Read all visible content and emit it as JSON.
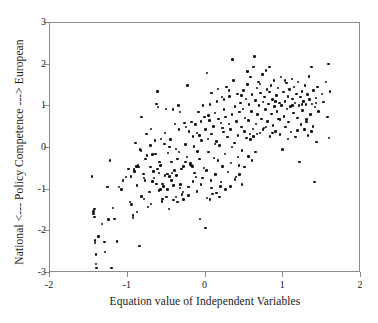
{
  "chart_data": {
    "type": "scatter",
    "title": "",
    "xlabel": "Equation value of Independent Variables",
    "ylabel": "National <--- Policy Competence ---> European",
    "xlim": [
      -2,
      2
    ],
    "ylim": [
      -3,
      3
    ],
    "xticks": [
      -2,
      -1,
      0,
      1,
      2
    ],
    "yticks": [
      -3,
      -2,
      -1,
      0,
      1,
      2,
      3
    ],
    "xtick_labels": [
      "-2",
      "-1",
      "0",
      "1",
      "2"
    ],
    "ytick_labels": [
      "-3",
      "-2",
      "-1",
      "0",
      "1",
      "2",
      "3"
    ],
    "grid": false,
    "legend": null,
    "marker": "filled-circle",
    "marker_color": "#111111",
    "frame_color": "#8a8a8a",
    "background": "#ffffff",
    "n_points": 330,
    "points": [
      [
        -1.44,
        -1.52
      ],
      [
        -1.44,
        -1.58
      ],
      [
        -1.43,
        -1.46
      ],
      [
        -1.43,
        -1.66
      ],
      [
        -1.42,
        -2.22
      ],
      [
        -1.42,
        -2.28
      ],
      [
        -1.41,
        -2.55
      ],
      [
        -1.41,
        -2.78
      ],
      [
        -1.4,
        -2.88
      ],
      [
        -1.46,
        -0.68
      ],
      [
        -1.38,
        -2.12
      ],
      [
        -1.33,
        -1.82
      ],
      [
        -1.3,
        -2.26
      ],
      [
        -1.29,
        -2.5
      ],
      [
        -1.26,
        -0.94
      ],
      [
        -1.25,
        -1.72
      ],
      [
        -1.23,
        -0.3
      ],
      [
        -1.21,
        -2.88
      ],
      [
        -1.19,
        -1.44
      ],
      [
        -1.17,
        -1.7
      ],
      [
        -1.14,
        -2.25
      ],
      [
        -1.11,
        -0.94
      ],
      [
        -1.08,
        -1.0
      ],
      [
        -1.06,
        -0.78
      ],
      [
        -0.97,
        -1.3
      ],
      [
        -0.95,
        -1.36
      ],
      [
        -0.93,
        -1.62
      ],
      [
        -0.93,
        -1.68
      ],
      [
        -0.92,
        -0.52
      ],
      [
        -0.91,
        -0.56
      ],
      [
        -0.9,
        0.12
      ],
      [
        -0.89,
        -0.44
      ],
      [
        -0.88,
        -1.54
      ],
      [
        -0.87,
        -0.42
      ],
      [
        -0.86,
        -0.46
      ],
      [
        -0.85,
        -2.35
      ],
      [
        -0.84,
        -0.04
      ],
      [
        -0.83,
        -0.06
      ],
      [
        -0.82,
        0.74
      ],
      [
        -0.8,
        -0.62
      ],
      [
        -0.79,
        -0.72
      ],
      [
        -0.78,
        -0.78
      ],
      [
        -0.77,
        -0.26
      ],
      [
        -0.76,
        0.34
      ],
      [
        -0.75,
        -0.18
      ],
      [
        -0.74,
        -1.42
      ],
      [
        -0.72,
        -1.06
      ],
      [
        -0.71,
        0.06
      ],
      [
        -0.7,
        0.46
      ],
      [
        -0.68,
        -0.8
      ],
      [
        -0.66,
        -0.72
      ],
      [
        -0.65,
        0.18
      ],
      [
        -0.64,
        -0.14
      ],
      [
        -0.63,
        1.06
      ],
      [
        -0.62,
        1.36
      ],
      [
        -0.61,
        0.98
      ],
      [
        -0.6,
        -0.6
      ],
      [
        -0.59,
        -0.34
      ],
      [
        -0.58,
        -0.42
      ],
      [
        -0.57,
        0.22
      ],
      [
        -0.56,
        -1.28
      ],
      [
        -0.55,
        -1.22
      ],
      [
        -0.54,
        -0.92
      ],
      [
        -0.53,
        0.1
      ],
      [
        -0.52,
        -0.66
      ],
      [
        -0.51,
        0.94
      ],
      [
        -0.5,
        -1.18
      ],
      [
        -0.49,
        -0.62
      ],
      [
        -0.48,
        -0.12
      ],
      [
        -0.47,
        -1.46
      ],
      [
        -0.46,
        -0.68
      ],
      [
        -0.45,
        0.21
      ],
      [
        -0.44,
        -0.34
      ],
      [
        -0.43,
        -0.6
      ],
      [
        -0.42,
        0.92
      ],
      [
        -0.41,
        -1.25
      ],
      [
        -0.4,
        -0.54
      ],
      [
        -0.39,
        0.58
      ],
      [
        -0.38,
        -0.02
      ],
      [
        -0.37,
        -0.66
      ],
      [
        -0.36,
        -0.26
      ],
      [
        -0.35,
        1.02
      ],
      [
        -0.34,
        -0.1
      ],
      [
        -0.33,
        0.86
      ],
      [
        -0.32,
        -0.88
      ],
      [
        -0.31,
        -0.5
      ],
      [
        -0.3,
        -1.12
      ],
      [
        -0.29,
        -1.06
      ],
      [
        -0.28,
        -0.44
      ],
      [
        -0.27,
        0.6
      ],
      [
        -0.26,
        -0.34
      ],
      [
        -0.25,
        0.5
      ],
      [
        -0.24,
        -0.22
      ],
      [
        -0.23,
        1.5
      ],
      [
        -0.22,
        -0.94
      ],
      [
        -0.21,
        0.4
      ],
      [
        -0.2,
        -0.4
      ],
      [
        -0.19,
        -0.36
      ],
      [
        -0.18,
        -0.42
      ],
      [
        -0.17,
        -0.44
      ],
      [
        -0.16,
        0.28
      ],
      [
        -0.15,
        0.04
      ],
      [
        -0.14,
        -0.6
      ],
      [
        -0.13,
        0.56
      ],
      [
        -0.12,
        -0.7
      ],
      [
        -0.11,
        0.36
      ],
      [
        -0.1,
        -0.08
      ],
      [
        -0.09,
        0.86
      ],
      [
        -0.08,
        -0.26
      ],
      [
        -0.07,
        -1.7
      ],
      [
        -0.06,
        0.64
      ],
      [
        -0.05,
        0.18
      ],
      [
        -0.04,
        -0.72
      ],
      [
        -0.03,
        1.02
      ],
      [
        -0.02,
        -0.48
      ],
      [
        -0.01,
        0.74
      ],
      [
        0.0,
        -1.92
      ],
      [
        0.0,
        0.44
      ],
      [
        0.01,
        -0.54
      ],
      [
        0.02,
        1.8
      ],
      [
        0.03,
        0.22
      ],
      [
        0.04,
        -0.1
      ],
      [
        0.05,
        0.66
      ],
      [
        0.06,
        1.04
      ],
      [
        0.07,
        -0.78
      ],
      [
        0.08,
        0.34
      ],
      [
        0.09,
        -1.1
      ],
      [
        0.1,
        0.52
      ],
      [
        0.11,
        -0.24
      ],
      [
        0.12,
        0.84
      ],
      [
        0.13,
        -0.64
      ],
      [
        0.14,
        0.16
      ],
      [
        0.15,
        1.12
      ],
      [
        0.16,
        -0.3
      ],
      [
        0.17,
        0.7
      ],
      [
        0.18,
        0.06
      ],
      [
        0.19,
        -0.92
      ],
      [
        0.2,
        0.6
      ],
      [
        0.21,
        1.22
      ],
      [
        0.22,
        -0.44
      ],
      [
        0.23,
        0.38
      ],
      [
        0.24,
        0.92
      ],
      [
        0.25,
        -0.14
      ],
      [
        0.26,
        0.74
      ],
      [
        0.27,
        1.46
      ],
      [
        0.28,
        0.26
      ],
      [
        0.29,
        -0.58
      ],
      [
        0.3,
        0.58
      ],
      [
        0.31,
        1.24
      ],
      [
        0.32,
        0.44
      ],
      [
        0.33,
        -0.36
      ],
      [
        0.34,
        0.8
      ],
      [
        0.35,
        2.12
      ],
      [
        0.36,
        1.62
      ],
      [
        0.37,
        0.12
      ],
      [
        0.38,
        1.0
      ],
      [
        0.39,
        -0.7
      ],
      [
        0.4,
        0.64
      ],
      [
        0.41,
        1.3
      ],
      [
        0.42,
        0.3
      ],
      [
        0.43,
        -0.42
      ],
      [
        0.44,
        0.86
      ],
      [
        0.45,
        1.08
      ],
      [
        0.46,
        0.5
      ],
      [
        0.47,
        -0.06
      ],
      [
        0.48,
        0.94
      ],
      [
        0.49,
        1.38
      ],
      [
        0.5,
        0.4
      ],
      [
        0.51,
        0.72
      ],
      [
        0.52,
        1.18
      ],
      [
        0.53,
        0.24
      ],
      [
        0.54,
        1.52
      ],
      [
        0.55,
        0.66
      ],
      [
        0.56,
        1.04
      ],
      [
        0.57,
        0.34
      ],
      [
        0.58,
        1.7
      ],
      [
        0.59,
        0.88
      ],
      [
        0.6,
        1.28
      ],
      [
        0.61,
        0.46
      ],
      [
        0.62,
        1.94
      ],
      [
        0.63,
        2.2
      ],
      [
        0.64,
        1.14
      ],
      [
        0.65,
        0.58
      ],
      [
        0.66,
        1.44
      ],
      [
        0.67,
        0.8
      ],
      [
        0.68,
        1.58
      ],
      [
        0.69,
        1.02
      ],
      [
        0.7,
        0.36
      ],
      [
        0.71,
        1.32
      ],
      [
        0.72,
        0.7
      ],
      [
        0.73,
        1.76
      ],
      [
        0.74,
        1.1
      ],
      [
        0.75,
        0.48
      ],
      [
        0.76,
        1.22
      ],
      [
        0.77,
        0.92
      ],
      [
        0.78,
        1.86
      ],
      [
        0.79,
        1.4
      ],
      [
        0.8,
        0.64
      ],
      [
        0.81,
        1.06
      ],
      [
        0.82,
        1.94
      ],
      [
        0.83,
        0.28
      ],
      [
        0.84,
        1.5
      ],
      [
        0.85,
        0.82
      ],
      [
        0.86,
        1.16
      ],
      [
        0.87,
        0.54
      ],
      [
        0.88,
        1.62
      ],
      [
        0.89,
        1.0
      ],
      [
        0.9,
        0.4
      ],
      [
        0.91,
        1.26
      ],
      [
        0.92,
        0.88
      ],
      [
        0.93,
        1.44
      ],
      [
        0.94,
        0.7
      ],
      [
        0.95,
        1.08
      ],
      [
        0.96,
        0.32
      ],
      [
        0.97,
        1.7
      ],
      [
        0.98,
        1.02
      ],
      [
        0.99,
        -0.04
      ],
      [
        1.0,
        1.34
      ],
      [
        1.01,
        0.76
      ],
      [
        1.02,
        1.12
      ],
      [
        1.03,
        0.5
      ],
      [
        1.04,
        1.56
      ],
      [
        1.05,
        0.94
      ],
      [
        1.06,
        1.24
      ],
      [
        1.07,
        0.62
      ],
      [
        1.08,
        1.4
      ],
      [
        1.09,
        1.0
      ],
      [
        1.1,
        0.38
      ],
      [
        1.11,
        1.66
      ],
      [
        1.12,
        1.18
      ],
      [
        1.13,
        0.84
      ],
      [
        1.14,
        1.46
      ],
      [
        1.15,
        1.08
      ],
      [
        1.16,
        0.26
      ],
      [
        1.17,
        1.3
      ],
      [
        1.18,
        0.72
      ],
      [
        1.19,
        1.58
      ],
      [
        1.2,
        1.02
      ],
      [
        1.21,
        -0.34
      ],
      [
        1.22,
        1.22
      ],
      [
        1.23,
        0.56
      ],
      [
        1.24,
        1.36
      ],
      [
        1.25,
        0.9
      ],
      [
        1.26,
        1.12
      ],
      [
        1.27,
        0.44
      ],
      [
        1.28,
        1.5
      ],
      [
        1.29,
        1.04
      ],
      [
        1.3,
        0.68
      ],
      [
        1.31,
        1.28
      ],
      [
        1.32,
        0.3
      ],
      [
        1.33,
        1.72
      ],
      [
        1.34,
        1.16
      ],
      [
        1.35,
        0.8
      ],
      [
        1.36,
        1.94
      ],
      [
        1.37,
        1.06
      ],
      [
        1.38,
        0.52
      ],
      [
        1.39,
        1.38
      ],
      [
        1.4,
        -0.82
      ],
      [
        1.41,
        0.98
      ],
      [
        1.42,
        1.2
      ],
      [
        1.43,
        0.14
      ],
      [
        1.44,
        1.46
      ],
      [
        1.45,
        0.88
      ],
      [
        1.5,
        1.3
      ],
      [
        1.52,
        1.1
      ],
      [
        1.55,
        1.58
      ],
      [
        1.57,
        0.74
      ],
      [
        1.58,
        2.02
      ],
      [
        1.59,
        0.24
      ],
      [
        1.6,
        1.36
      ],
      [
        -0.99,
        -0.5
      ],
      [
        -0.96,
        -0.68
      ],
      [
        -0.88,
        -0.9
      ],
      [
        -0.82,
        -1.16
      ],
      [
        -0.79,
        -1.22
      ],
      [
        -0.7,
        -1.34
      ],
      [
        -0.67,
        -0.56
      ],
      [
        -0.6,
        -1.02
      ],
      [
        -0.55,
        -0.86
      ],
      [
        -0.49,
        -1.0
      ],
      [
        -0.44,
        -0.78
      ],
      [
        -0.38,
        -1.18
      ],
      [
        -0.33,
        -0.96
      ],
      [
        -0.28,
        -1.24
      ],
      [
        -0.22,
        -1.14
      ],
      [
        -0.16,
        -0.8
      ],
      [
        -0.11,
        -1.04
      ],
      [
        -0.06,
        -0.88
      ],
      [
        0.02,
        -1.2
      ],
      [
        0.08,
        -0.96
      ],
      [
        0.14,
        -1.08
      ],
      [
        0.2,
        -0.82
      ],
      [
        0.26,
        -1.0
      ],
      [
        0.32,
        -0.92
      ],
      [
        0.38,
        -0.76
      ],
      [
        0.44,
        -0.64
      ],
      [
        0.5,
        -0.46
      ],
      [
        0.08,
        1.32
      ],
      [
        0.16,
        1.42
      ],
      [
        0.24,
        1.16
      ],
      [
        0.46,
        1.26
      ],
      [
        0.54,
        1.84
      ],
      [
        0.58,
        0.2
      ],
      [
        0.62,
        0.28
      ],
      [
        0.66,
        0.34
      ],
      [
        0.7,
        1.54
      ],
      [
        0.74,
        0.44
      ],
      [
        0.78,
        0.5
      ],
      [
        0.82,
        1.34
      ],
      [
        0.86,
        0.36
      ],
      [
        0.9,
        1.12
      ],
      [
        0.96,
        0.68
      ],
      [
        1.02,
        1.62
      ],
      [
        1.06,
        0.22
      ],
      [
        1.12,
        1.02
      ],
      [
        1.18,
        0.42
      ],
      [
        1.24,
        1.04
      ],
      [
        1.3,
        0.62
      ],
      [
        1.36,
        0.4
      ],
      [
        1.42,
        1.08
      ],
      [
        -0.52,
        0.36
      ],
      [
        -0.46,
        0.02
      ],
      [
        -0.34,
        0.44
      ],
      [
        -0.26,
        0.08
      ],
      [
        -0.18,
        0.62
      ],
      [
        -0.08,
        0.3
      ],
      [
        0.04,
        0.78
      ],
      [
        0.12,
        0.1
      ],
      [
        0.22,
        0.48
      ],
      [
        0.3,
        1.38
      ],
      [
        0.34,
        0.02
      ],
      [
        -0.63,
        -0.86
      ],
      [
        -0.58,
        -1.0
      ],
      [
        -1.02,
        -0.7
      ],
      [
        -0.71,
        -0.46
      ],
      [
        -0.68,
        -0.16
      ],
      [
        -0.62,
        -0.5
      ],
      [
        -0.41,
        -0.9
      ],
      [
        -0.36,
        -1.3
      ],
      [
        0.06,
        -1.24
      ],
      [
        0.12,
        -0.62
      ],
      [
        0.18,
        -1.18
      ],
      [
        0.42,
        -0.22
      ],
      [
        0.47,
        -0.88
      ],
      [
        0.55,
        -0.2
      ],
      [
        0.6,
        -0.3
      ],
      [
        0.64,
        -0.1
      ]
    ]
  }
}
